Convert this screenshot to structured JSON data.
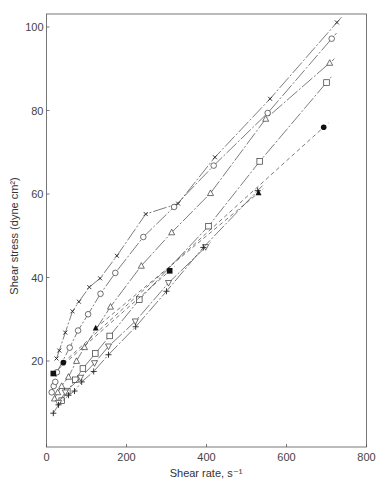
{
  "chart_data": {
    "type": "scatter",
    "title": "",
    "xlabel": "Shear rate, s⁻¹",
    "ylabel": "Shear stress (dyne cm²)",
    "xlim": [
      0,
      800
    ],
    "ylim": [
      0,
      103
    ],
    "xticks": [
      0,
      200,
      400,
      600,
      800
    ],
    "yticks": [
      20,
      40,
      60,
      80,
      100
    ],
    "grid": false,
    "legend": null,
    "series": [
      {
        "name": "x-marker",
        "marker": "x",
        "line": "dashdot",
        "points": [
          [
            25,
            20.6
          ],
          [
            32,
            22.5
          ],
          [
            47,
            26.8
          ],
          [
            65,
            31.9
          ],
          [
            81,
            34.2
          ],
          [
            107,
            37.7
          ],
          [
            134,
            39.8
          ],
          [
            176,
            45.2
          ],
          [
            248,
            55.2
          ],
          [
            329,
            57.7
          ],
          [
            421,
            68.8
          ],
          [
            559,
            82.8
          ],
          [
            726,
            101.1
          ]
        ]
      },
      {
        "name": "open-circle",
        "marker": "o",
        "line": "dashdot",
        "points": [
          [
            13,
            12.5
          ],
          [
            18,
            14
          ],
          [
            22,
            15
          ],
          [
            26,
            17.3
          ],
          [
            58,
            23.2
          ],
          [
            79,
            27.3
          ],
          [
            104,
            31.2
          ],
          [
            135,
            36.1
          ],
          [
            172,
            41.1
          ],
          [
            242,
            49.7
          ],
          [
            319,
            56.9
          ],
          [
            418,
            66.8
          ],
          [
            553,
            79.4
          ],
          [
            713,
            97.2
          ]
        ]
      },
      {
        "name": "open-triangle",
        "marker": "^",
        "line": "dashdot",
        "points": [
          [
            20,
            11
          ],
          [
            28,
            12.5
          ],
          [
            38,
            14
          ],
          [
            55,
            16.2
          ],
          [
            75,
            20
          ],
          [
            95,
            23.3
          ],
          [
            160,
            33
          ],
          [
            237,
            42.8
          ],
          [
            313,
            50.8
          ],
          [
            410,
            60.2
          ],
          [
            548,
            78
          ],
          [
            708,
            91.4
          ]
        ]
      },
      {
        "name": "open-square",
        "marker": "s",
        "line": "dashdot",
        "points": [
          [
            38,
            10.5
          ],
          [
            52,
            12.8
          ],
          [
            72,
            15.5
          ],
          [
            91,
            18.2
          ],
          [
            122,
            21.8
          ],
          [
            158,
            26
          ],
          [
            232,
            34.7
          ],
          [
            405,
            52.3
          ],
          [
            533,
            67.8
          ],
          [
            700,
            86.7
          ]
        ]
      },
      {
        "name": "open-inverted-triangle",
        "marker": "v",
        "line": "dashdot",
        "points": [
          [
            30,
            10
          ],
          [
            47,
            12.5
          ],
          [
            85,
            16
          ],
          [
            120,
            19.5
          ],
          [
            155,
            23.5
          ],
          [
            222,
            29.5
          ],
          [
            305,
            38.7
          ],
          [
            398,
            47.3
          ]
        ]
      },
      {
        "name": "plus",
        "marker": "+",
        "line": "dashdot",
        "points": [
          [
            17,
            7.5
          ],
          [
            30,
            9.5
          ],
          [
            55,
            11.8
          ],
          [
            70,
            12.8
          ],
          [
            88,
            15
          ],
          [
            118,
            17.5
          ],
          [
            155,
            21.5
          ],
          [
            223,
            28.2
          ],
          [
            300,
            36.7
          ],
          [
            392,
            47.2
          ],
          [
            528,
            60.8
          ]
        ]
      },
      {
        "name": "filled-square",
        "marker": "s-filled",
        "line": "dashed",
        "points": [
          [
            17,
            17
          ],
          [
            308,
            41.6
          ]
        ]
      },
      {
        "name": "filled-circle",
        "marker": "o-filled",
        "line": "dashed",
        "points": [
          [
            42,
            19.6
          ],
          [
            693,
            76
          ]
        ]
      },
      {
        "name": "filled-triangle",
        "marker": "^-filled",
        "line": "dashed",
        "points": [
          [
            123,
            27.9
          ],
          [
            530,
            60.3
          ]
        ]
      }
    ]
  }
}
